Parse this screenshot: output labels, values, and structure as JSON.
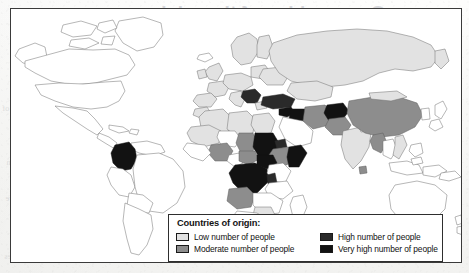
{
  "document": {
    "type": "scanned-textbook-page",
    "figure_kind": "world-choropleth-map"
  },
  "ghost_text": {
    "note": "faint mirrored show-through from the reverse side of the printed page",
    "title": "Geographies of the crisis",
    "left_lines": [
      "and so the number of",
      "people who are",
      "displaced across",
      "borders has grown",
      "rapidly in recent",
      "years. Most of the",
      "refugees come from",
      "a small number of",
      "countries, and the",
      "majority of the",
      "world's refugees are",
      "hosted in the",
      "countries that",
      "neighbour the",
      "conflict zones."
    ],
    "right_lines": [
      "of people who are",
      "forced to flee their",
      "homes, and the scale",
      "of the movement has",
      "increased sharply as",
      "new conflicts have",
      "emerged in several",
      "regions of the world."
    ],
    "bottom_line": "Figure 2.4  Countries of origin of the world's refugees"
  },
  "legend": {
    "title": "Countries of origin:",
    "items": [
      {
        "label": "Low number of people",
        "color": "#e2e2e2",
        "level": 1,
        "column": "left"
      },
      {
        "label": "Moderate number of people",
        "color": "#8d8d8d",
        "level": 2,
        "column": "left"
      },
      {
        "label": "High number of people",
        "color": "#2a2a2a",
        "level": 3,
        "column": "right"
      },
      {
        "label": "Very high number of people",
        "color": "#121212",
        "level": 4,
        "column": "right"
      }
    ]
  },
  "map": {
    "projection": "cylindrical",
    "frame_color": "#3a3a3a",
    "unshaded_color": "#ffffff",
    "outline_color": "#6e6e6e",
    "classes": {
      "1": {
        "name": "Low number of people",
        "color": "#e2e2e2"
      },
      "2": {
        "name": "Moderate number of people",
        "color": "#8d8d8d"
      },
      "3": {
        "name": "High number of people",
        "color": "#2a2a2a"
      },
      "4": {
        "name": "Very high number of people",
        "color": "#121212"
      }
    },
    "shaded_regions": [
      {
        "name": "Russian Federation",
        "class": 1
      },
      {
        "name": "China",
        "class": 2
      },
      {
        "name": "India",
        "class": 1
      },
      {
        "name": "Pakistan",
        "class": 2
      },
      {
        "name": "Afghanistan",
        "class": 4
      },
      {
        "name": "Iran",
        "class": 2
      },
      {
        "name": "Iraq",
        "class": 4
      },
      {
        "name": "Syria",
        "class": 4
      },
      {
        "name": "Turkey",
        "class": 3
      },
      {
        "name": "Former Yugoslavia",
        "class": 3
      },
      {
        "name": "Ukraine",
        "class": 1
      },
      {
        "name": "Western Europe",
        "class": 1
      },
      {
        "name": "Algeria",
        "class": 1
      },
      {
        "name": "Libya",
        "class": 1
      },
      {
        "name": "Egypt",
        "class": 1
      },
      {
        "name": "Sudan",
        "class": 4
      },
      {
        "name": "South Sudan",
        "class": 4
      },
      {
        "name": "Eritrea",
        "class": 3
      },
      {
        "name": "Ethiopia",
        "class": 2
      },
      {
        "name": "Somalia",
        "class": 4
      },
      {
        "name": "Dem. Rep. of Congo",
        "class": 4
      },
      {
        "name": "Central African Rep.",
        "class": 2
      },
      {
        "name": "Chad",
        "class": 2
      },
      {
        "name": "Nigeria",
        "class": 2
      },
      {
        "name": "Mali",
        "class": 1
      },
      {
        "name": "Burundi",
        "class": 3
      },
      {
        "name": "Rwanda",
        "class": 3
      },
      {
        "name": "Angola",
        "class": 2
      },
      {
        "name": "Zimbabwe",
        "class": 1
      },
      {
        "name": "Colombia",
        "class": 4
      },
      {
        "name": "Myanmar",
        "class": 2
      },
      {
        "name": "Vietnam",
        "class": 1
      },
      {
        "name": "Sri Lanka",
        "class": 2
      }
    ],
    "unshaded_regions": [
      "United States",
      "Canada",
      "Mexico",
      "Brazil",
      "Argentina",
      "Australia",
      "New Zealand",
      "Greenland",
      "Saudi Arabia",
      "Japan"
    ]
  }
}
